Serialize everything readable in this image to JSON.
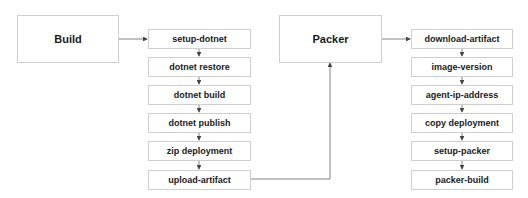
{
  "diagram": {
    "stages": [
      {
        "label": "Build"
      },
      {
        "label": "Packer"
      }
    ],
    "build_steps": [
      {
        "label": "setup-dotnet"
      },
      {
        "label": "dotnet restore"
      },
      {
        "label": "dotnet build"
      },
      {
        "label": "dotnet publish"
      },
      {
        "label": "zip deployment"
      },
      {
        "label": "upload-artifact"
      }
    ],
    "packer_steps": [
      {
        "label": "download-artifact"
      },
      {
        "label": "image-version"
      },
      {
        "label": "agent-ip-address"
      },
      {
        "label": "copy deployment"
      },
      {
        "label": "setup-packer"
      },
      {
        "label": "packer-build"
      }
    ],
    "colors": {
      "border": "#cfcfcf",
      "line": "#555555",
      "text": "#1a1a1a"
    }
  }
}
